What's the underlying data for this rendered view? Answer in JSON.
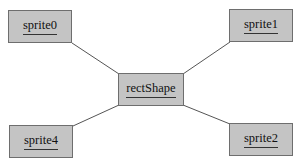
{
  "diagram": {
    "background": "#ffffff",
    "node_fill": "#c4c4c4",
    "node_border": "#6e6e6e",
    "edge_color": "#555555",
    "center": {
      "label": "rectShape"
    },
    "nodes": [
      {
        "id": "sprite0",
        "label": "sprite0"
      },
      {
        "id": "sprite1",
        "label": "sprite1"
      },
      {
        "id": "sprite2",
        "label": "sprite2"
      },
      {
        "id": "sprite4",
        "label": "sprite4"
      }
    ],
    "edges": [
      {
        "from": "rectShape",
        "to": "sprite0"
      },
      {
        "from": "rectShape",
        "to": "sprite1"
      },
      {
        "from": "rectShape",
        "to": "sprite2"
      },
      {
        "from": "rectShape",
        "to": "sprite4"
      }
    ]
  }
}
